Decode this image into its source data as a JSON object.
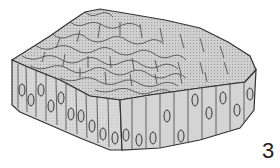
{
  "figure": {
    "label": "3",
    "colors": {
      "fill": "#d6d6d6",
      "top_fill": "#c8c8c8",
      "stroke": "#333333",
      "background": "#ffffff"
    }
  }
}
